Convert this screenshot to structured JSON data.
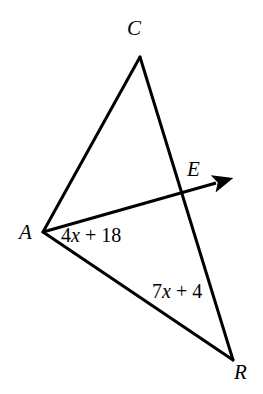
{
  "figure": {
    "background_color": "#ffffff",
    "stroke_color": "#000000",
    "stroke_width": 3,
    "width": 263,
    "height": 394
  },
  "vertices": [
    {
      "id": "C",
      "label": "C",
      "point_x": 140,
      "point_y": 57,
      "label_x": 127,
      "label_y": 18
    },
    {
      "id": "E",
      "label": "E",
      "point_x": 185,
      "point_y": 192,
      "label_x": 187,
      "label_y": 159
    },
    {
      "id": "A",
      "label": "A",
      "point_x": 43,
      "point_y": 232,
      "label_x": 19,
      "label_y": 222
    },
    {
      "id": "R",
      "label": "R",
      "point_x": 233,
      "point_y": 360,
      "label_x": 234,
      "label_y": 362
    }
  ],
  "segments": [
    {
      "id": "CA",
      "from": "C",
      "to": "A",
      "arrow": false
    },
    {
      "id": "CR",
      "from": "C",
      "to": "R",
      "arrow": false
    },
    {
      "id": "AR",
      "from": "A",
      "to": "R",
      "arrow": false
    },
    {
      "id": "AE-ray",
      "from": "A",
      "to": "E",
      "arrow": true,
      "arrow_tip_x": 228,
      "arrow_tip_y": 180
    }
  ],
  "segment_labels": [
    {
      "id": "label-ae",
      "for_segment": "CE",
      "full_text": "4x + 18",
      "coefficient": "4",
      "variable": "x",
      "operator": " + ",
      "constant": "18",
      "x": 61,
      "y": 225
    },
    {
      "id": "label-er",
      "for_segment": "ER",
      "full_text": "7x + 4",
      "coefficient": "7",
      "variable": "x",
      "operator": " + ",
      "constant": "4",
      "x": 152,
      "y": 281
    }
  ]
}
